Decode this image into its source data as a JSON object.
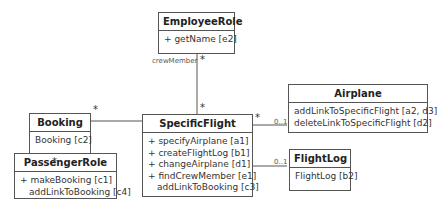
{
  "classes": {
    "employee_role": {
      "name": "EmployeeRole",
      "ops": [
        "+ getName [e2]"
      ]
    },
    "booking": {
      "name": "Booking",
      "ops": [
        "Booking [c2]"
      ]
    },
    "specific_flight": {
      "name": "SpecificFlight",
      "ops": [
        "+ specifyAirplane [a1]",
        "+ createFlightLog [b1]",
        "+ changeAirplane [d1]",
        "+ findCrewMember [e1]",
        "addLinkToBooking [c3]"
      ]
    },
    "airplane": {
      "name": "Airplane",
      "ops": [
        "addLinkToSpecificFlight [a2, d3]",
        "deleteLinkToSpecificFlight [d2]"
      ]
    },
    "passenger_role": {
      "name": "PassengerRole",
      "ops": [
        "+ makeBooking [c1]",
        "addLinkToBooking [c4]"
      ]
    },
    "flight_log": {
      "name": "FlightLog",
      "ops": [
        "FlightLog [b2]"
      ]
    }
  },
  "associations": {
    "crew_role_label": "crewMember",
    "employee_end": "*",
    "flight_crew_end": "*",
    "booking_flight_end": "*",
    "booking_passenger_end": "*",
    "flight_airplane_end_flight": "*",
    "flight_airplane_end_airplane": "0..1",
    "flight_log_end": "0..1"
  }
}
